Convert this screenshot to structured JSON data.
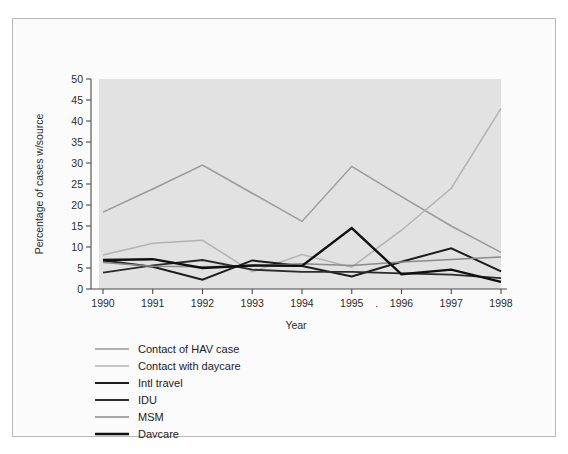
{
  "chart_data": {
    "type": "line",
    "title": "",
    "xlabel": "Year",
    "ylabel": "Percentage of cases w/source",
    "categories": [
      1990,
      1991,
      1992,
      1993,
      1994,
      1995,
      1996,
      1997,
      1998
    ],
    "x_tick_labels": [
      "1990",
      "1991",
      "1992",
      "1993",
      "1994",
      "1995",
      "1996",
      "1997",
      "1998"
    ],
    "y_tick_labels": [
      "0",
      "5",
      "10",
      "15",
      "20",
      "25",
      "30",
      "35",
      "40",
      "45",
      "50"
    ],
    "ylim": [
      0,
      50
    ],
    "y_tick_step": 5,
    "grid": false,
    "legend_position": "below-left",
    "plot_background": "#e2e2e2",
    "stray_marks": [
      "."
    ],
    "series": [
      {
        "name": "Contact of HAV case",
        "color": "#9a9a9a",
        "width": 1.5,
        "values": [
          18.3,
          23.8,
          29.5,
          22.8,
          16.1,
          29.2,
          22.0,
          15.0,
          8.7
        ]
      },
      {
        "name": "Contact with daycare",
        "color": "#b3b3b3",
        "width": 1.5,
        "values": [
          8.1,
          10.9,
          11.6,
          4.1,
          8.2,
          5.2,
          14.0,
          24.0,
          43.0
        ]
      },
      {
        "name": "Intl travel",
        "color": "#1c1c1c",
        "width": 2.0,
        "values": [
          6.8,
          5.3,
          2.2,
          6.8,
          5.5,
          3.0,
          6.5,
          9.7,
          4.2
        ]
      },
      {
        "name": "IDU",
        "color": "#2b2b2b",
        "width": 1.8,
        "values": [
          3.9,
          5.6,
          6.9,
          4.6,
          4.1,
          4.1,
          3.7,
          3.4,
          2.6
        ]
      },
      {
        "name": "MSM",
        "color": "#8a8a8a",
        "width": 1.5,
        "values": [
          6.3,
          5.4,
          5.3,
          5.5,
          6.0,
          5.6,
          6.4,
          7.0,
          7.6
        ]
      },
      {
        "name": "Daycare",
        "color": "#101010",
        "width": 2.4,
        "values": [
          6.9,
          7.1,
          5.0,
          5.6,
          5.5,
          14.5,
          3.5,
          4.6,
          1.7
        ]
      }
    ],
    "legend_entries": [
      {
        "label": "Contact of HAV case",
        "color": "#9a9a9a",
        "width": 1.5
      },
      {
        "label": "Contact with daycare",
        "color": "#b3b3b3",
        "width": 1.5
      },
      {
        "label": "Intl travel",
        "color": "#1c1c1c",
        "width": 2.0
      },
      {
        "label": "IDU",
        "color": "#2b2b2b",
        "width": 1.8
      },
      {
        "label": "MSM",
        "color": "#8a8a8a",
        "width": 1.5
      },
      {
        "label": "Daycare",
        "color": "#101010",
        "width": 2.4
      }
    ]
  }
}
